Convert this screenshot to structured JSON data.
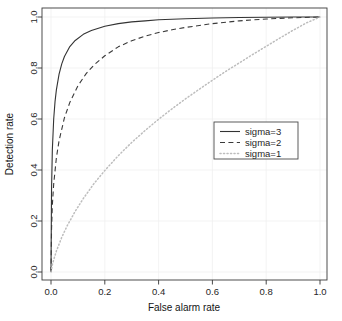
{
  "chart_data": {
    "type": "line",
    "title": "",
    "xlabel": "False alarm rate",
    "ylabel": "Detection rate",
    "xlim": [
      0.0,
      1.0
    ],
    "ylim": [
      0.0,
      1.0
    ],
    "xticks": [
      "0.0",
      "0.2",
      "0.4",
      "0.6",
      "0.8",
      "1.0"
    ],
    "xtick_values": [
      0.0,
      0.2,
      0.4,
      0.6,
      0.8,
      1.0
    ],
    "yticks": [
      "0.0",
      "0.2",
      "0.4",
      "0.6",
      "0.8",
      "1.0"
    ],
    "ytick_values": [
      0.0,
      0.2,
      0.4,
      0.6,
      0.8,
      1.0
    ],
    "grid": true,
    "grid_color": "#f0f0f0",
    "legend_position": "center-right",
    "axis_color": "#333333",
    "series": [
      {
        "name": "sigma=3",
        "linestyle": "solid",
        "color": "#333333",
        "x": [
          0.0,
          0.002,
          0.005,
          0.01,
          0.015,
          0.02,
          0.03,
          0.04,
          0.05,
          0.07,
          0.09,
          0.12,
          0.15,
          0.2,
          0.25,
          0.3,
          0.35,
          0.4,
          0.5,
          0.6,
          0.7,
          0.8,
          0.9,
          1.0
        ],
        "y": [
          0.0,
          0.322,
          0.478,
          0.6,
          0.668,
          0.714,
          0.776,
          0.816,
          0.845,
          0.884,
          0.908,
          0.932,
          0.947,
          0.964,
          0.974,
          0.981,
          0.985,
          0.989,
          0.993,
          0.996,
          0.998,
          0.999,
          1.0,
          1.0
        ]
      },
      {
        "name": "sigma=2",
        "linestyle": "dashed",
        "color": "#3a3a3a",
        "x": [
          0.0,
          0.002,
          0.005,
          0.01,
          0.02,
          0.03,
          0.05,
          0.07,
          0.1,
          0.13,
          0.16,
          0.2,
          0.25,
          0.3,
          0.35,
          0.4,
          0.45,
          0.5,
          0.6,
          0.7,
          0.8,
          0.9,
          1.0
        ],
        "y": [
          0.0,
          0.168,
          0.262,
          0.345,
          0.448,
          0.515,
          0.605,
          0.665,
          0.73,
          0.777,
          0.812,
          0.848,
          0.883,
          0.907,
          0.925,
          0.939,
          0.95,
          0.959,
          0.974,
          0.985,
          0.992,
          0.997,
          1.0
        ]
      },
      {
        "name": "sigma=1",
        "linestyle": "dotted",
        "color": "#bdbdbd",
        "x": [
          0.0,
          0.005,
          0.01,
          0.02,
          0.04,
          0.06,
          0.09,
          0.12,
          0.16,
          0.2,
          0.25,
          0.3,
          0.35,
          0.4,
          0.45,
          0.5,
          0.55,
          0.6,
          0.65,
          0.7,
          0.75,
          0.8,
          0.85,
          0.9,
          0.95,
          1.0
        ],
        "y": [
          0.0,
          0.028,
          0.048,
          0.082,
          0.136,
          0.181,
          0.238,
          0.288,
          0.347,
          0.398,
          0.456,
          0.508,
          0.555,
          0.599,
          0.64,
          0.679,
          0.716,
          0.752,
          0.787,
          0.82,
          0.853,
          0.885,
          0.917,
          0.948,
          0.977,
          1.0
        ]
      }
    ]
  },
  "legend": {
    "entries": [
      {
        "label": "sigma=3",
        "style": "solid"
      },
      {
        "label": "sigma=2",
        "style": "dashed"
      },
      {
        "label": "sigma=1",
        "style": "dotted"
      }
    ]
  }
}
